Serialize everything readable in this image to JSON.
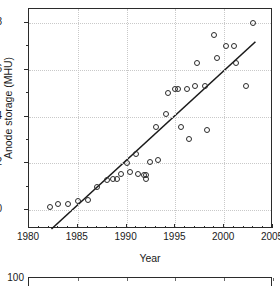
{
  "chart_data": {
    "type": "scatter",
    "title": "",
    "xlabel": "Year",
    "ylabel": "Anode storage (MHU)",
    "xlim": [
      1980,
      2005
    ],
    "ylim": [
      -0.8,
      8.6
    ],
    "grid": true,
    "legend": null,
    "xticks": [
      1980,
      1985,
      1990,
      1995,
      2000,
      2005
    ],
    "xtick_labels": [
      "1980",
      "1985",
      "1990",
      "1995",
      "2000",
      "2005"
    ],
    "yticks": [
      0,
      2,
      4,
      6,
      8
    ],
    "ytick_labels": [
      "0",
      "2",
      "4",
      "6",
      "8"
    ],
    "marker": "open-circle",
    "points": [
      {
        "x": 1982.2,
        "y": 0.15
      },
      {
        "x": 1983.0,
        "y": 0.25
      },
      {
        "x": 1984.0,
        "y": 0.28
      },
      {
        "x": 1985.0,
        "y": 0.4
      },
      {
        "x": 1986.0,
        "y": 0.45
      },
      {
        "x": 1987.0,
        "y": 1.0
      },
      {
        "x": 1988.0,
        "y": 1.3
      },
      {
        "x": 1988.6,
        "y": 1.35
      },
      {
        "x": 1989.0,
        "y": 1.35
      },
      {
        "x": 1989.4,
        "y": 1.55
      },
      {
        "x": 1990.0,
        "y": 2.0
      },
      {
        "x": 1990.3,
        "y": 1.65
      },
      {
        "x": 1991.0,
        "y": 2.4
      },
      {
        "x": 1991.2,
        "y": 1.55
      },
      {
        "x": 1991.8,
        "y": 1.5
      },
      {
        "x": 1992.0,
        "y": 1.35
      },
      {
        "x": 1992.0,
        "y": 1.5
      },
      {
        "x": 1992.4,
        "y": 2.05
      },
      {
        "x": 1993.0,
        "y": 3.55
      },
      {
        "x": 1993.2,
        "y": 2.15
      },
      {
        "x": 1994.0,
        "y": 4.1
      },
      {
        "x": 1994.2,
        "y": 5.0
      },
      {
        "x": 1995.0,
        "y": 5.2
      },
      {
        "x": 1995.3,
        "y": 5.2
      },
      {
        "x": 1995.6,
        "y": 3.55
      },
      {
        "x": 1996.2,
        "y": 5.2
      },
      {
        "x": 1996.4,
        "y": 3.05
      },
      {
        "x": 1997.0,
        "y": 5.3
      },
      {
        "x": 1997.2,
        "y": 6.3
      },
      {
        "x": 1998.0,
        "y": 5.3
      },
      {
        "x": 1998.2,
        "y": 3.45
      },
      {
        "x": 1999.0,
        "y": 7.5
      },
      {
        "x": 1999.3,
        "y": 6.5
      },
      {
        "x": 2000.2,
        "y": 7.0
      },
      {
        "x": 2001.0,
        "y": 7.0
      },
      {
        "x": 2001.2,
        "y": 6.3
      },
      {
        "x": 2002.2,
        "y": 5.3
      },
      {
        "x": 2003.0,
        "y": 8.0
      }
    ],
    "fit_line": {
      "label": "linear regression",
      "x": [
        1982.3,
        2003.2
      ],
      "y": [
        -0.8,
        7.2
      ]
    }
  },
  "secondary_chart": {
    "ytick_label": "100"
  }
}
